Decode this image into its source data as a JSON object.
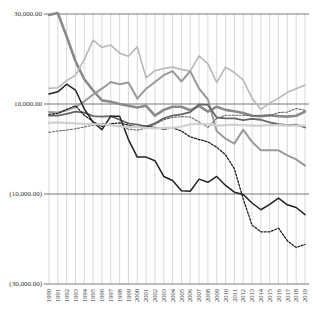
{
  "chart_data": {
    "type": "line",
    "title": "",
    "xlabel": "",
    "ylabel": "",
    "ylim": [
      -30000,
      30000
    ],
    "y_ticks": [
      30000,
      10000,
      -10000,
      -30000
    ],
    "y_tick_labels": [
      "30,000.00",
      "10,000.00",
      "(10,000.00)",
      "(30,000.00)"
    ],
    "grid": {
      "vertical": true,
      "horizontal": true
    },
    "legend": "none",
    "x": [
      1990,
      1991,
      1992,
      1993,
      1994,
      1995,
      1996,
      1997,
      1998,
      1999,
      2000,
      2001,
      2002,
      2003,
      2004,
      2005,
      2006,
      2007,
      2008,
      2009,
      2010,
      2011,
      2012,
      2013,
      2014,
      2015,
      2016,
      2017,
      2018,
      2019
    ],
    "series": [
      {
        "name": "Series 1 (thick grey, from top)",
        "style": {
          "color": "#8a8a8a",
          "width": 2.6,
          "dash": ""
        },
        "values": [
          29800,
          30200,
          25000,
          19500,
          15500,
          13000,
          10800,
          10500,
          10000,
          9600,
          9200,
          9600,
          7400,
          8700,
          9400,
          9400,
          8600,
          9600,
          8300,
          9400,
          8700,
          8400,
          8000,
          7400,
          7300,
          7500,
          7300,
          7200,
          7400,
          8300
        ]
      },
      {
        "name": "Series 2 (light grey, high)",
        "style": {
          "color": "#b8b8b8",
          "width": 1.6,
          "dash": ""
        },
        "values": [
          13500,
          13600,
          15200,
          16400,
          19900,
          24200,
          22600,
          23100,
          21300,
          20600,
          22700,
          15800,
          17400,
          17900,
          18200,
          17700,
          17300,
          20700,
          18900,
          14800,
          18200,
          17000,
          15300,
          11300,
          8800,
          10200,
          11300,
          12600,
          13400,
          14200
        ]
      },
      {
        "name": "Series 3 (medium grey, arcs then falls)",
        "style": {
          "color": "#9a9a9a",
          "width": 2.0,
          "dash": ""
        },
        "values": [
          8200,
          8100,
          8600,
          9300,
          10600,
          12100,
          13400,
          14900,
          14400,
          14800,
          11200,
          13400,
          14900,
          16400,
          17300,
          15000,
          17300,
          13400,
          11000,
          4000,
          2300,
          1200,
          4300,
          1600,
          -300,
          -300,
          -300,
          -1400,
          -2300,
          -3700
        ]
      },
      {
        "name": "Series 4 (dark grey, mid)",
        "style": {
          "color": "#666666",
          "width": 1.8,
          "dash": ""
        },
        "values": [
          7400,
          7400,
          7800,
          8300,
          8100,
          7300,
          7200,
          7300,
          6500,
          5700,
          5400,
          5000,
          5700,
          6800,
          7400,
          7700,
          8200,
          9900,
          9800,
          7000,
          6800,
          6800,
          6400,
          6700,
          6500,
          5900,
          5500,
          5300,
          5400,
          4800
        ]
      },
      {
        "name": "Series 5 (black solid, declines)",
        "style": {
          "color": "#222222",
          "width": 1.5,
          "dash": ""
        },
        "values": [
          12200,
          12700,
          14400,
          13100,
          8900,
          5900,
          4300,
          7300,
          7300,
          2100,
          -1800,
          -1800,
          -2600,
          -6100,
          -7000,
          -9300,
          -9400,
          -6700,
          -7400,
          -6100,
          -8100,
          -9600,
          -10100,
          -12000,
          -13500,
          -12300,
          -10900,
          -12400,
          -13000,
          -14600
        ]
      },
      {
        "name": "Series 6 (black dotted, steep decline)",
        "style": {
          "color": "#222222",
          "width": 1.3,
          "dash": "2,1.6"
        },
        "values": [
          7700,
          7900,
          8800,
          9600,
          7500,
          6100,
          5000,
          5600,
          5800,
          5300,
          4900,
          5100,
          4800,
          4400,
          4700,
          4000,
          2700,
          2100,
          1600,
          400,
          -1300,
          -4400,
          -11100,
          -16900,
          -18400,
          -18400,
          -17600,
          -20400,
          -21900,
          -21200
        ]
      },
      {
        "name": "Series 7 (grey dotted)",
        "style": {
          "color": "#666666",
          "width": 1.1,
          "dash": "2,1.6"
        },
        "values": [
          3700,
          4000,
          4200,
          4500,
          4900,
          5300,
          5700,
          5300,
          5200,
          4400,
          4200,
          4600,
          5500,
          6500,
          7000,
          7200,
          7100,
          6000,
          4800,
          6800,
          7500,
          7500,
          7500,
          7400,
          7400,
          7400,
          8100,
          8200,
          9000,
          8600
        ]
      },
      {
        "name": "Series 8 (very light grey, flat)",
        "style": {
          "color": "#d0d0d0",
          "width": 2.2,
          "dash": ""
        },
        "values": [
          5800,
          5900,
          5800,
          5700,
          5600,
          5500,
          5500,
          5300,
          5000,
          4900,
          4900,
          4700,
          4600,
          4700,
          4700,
          5000,
          5500,
          5600,
          5500,
          5200,
          5300,
          5400,
          5300,
          5200,
          5200,
          5300,
          5300,
          5200,
          5200,
          5200
        ]
      }
    ]
  },
  "axis": {
    "y_labels": [
      "30,000.00",
      "10,000.00",
      "(10,000.00)",
      "(30,000.00)"
    ],
    "x_labels": [
      "1990",
      "1991",
      "1992",
      "1993",
      "1994",
      "1995",
      "1996",
      "1997",
      "1998",
      "1999",
      "2000",
      "2001",
      "2002",
      "2003",
      "2004",
      "2005",
      "2006",
      "2007",
      "2008",
      "2009",
      "2010",
      "2011",
      "2012",
      "2013",
      "2014",
      "2015",
      "2016",
      "2017",
      "2018",
      "2019"
    ]
  },
  "colors": {
    "gridline": "#cfcfcf",
    "axis_line": "#555555",
    "background": "#ffffff"
  }
}
